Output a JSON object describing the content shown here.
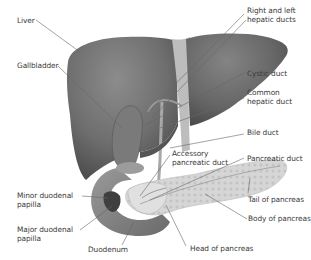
{
  "diagram": {
    "colors": {
      "liver": "#6f6f6f",
      "liver_shadow": "#4a4a4a",
      "ligament": "#b9b9b9",
      "duodenum": "#8a8a8a",
      "pancreas": "#d4d4d4",
      "leader_line": "#555555",
      "label_text": "#3a3a3a"
    },
    "labels": {
      "liver": "Liver",
      "gallbladder": "Gallbladder",
      "right_left_hepatic_1": "Right and left",
      "right_left_hepatic_2": "hepatic ducts",
      "cystic_duct": "Cystic duct",
      "common_hepatic_1": "Common",
      "common_hepatic_2": "hepatic duct",
      "bile_duct": "Bile duct",
      "accessory_1": "Accessory",
      "accessory_2": "pancreatic duct",
      "pancreatic_duct": "Pancreatic duct",
      "minor_papilla_1": "Minor duodenal",
      "minor_papilla_2": "papilla",
      "major_papilla_1": "Major duodenal",
      "major_papilla_2": "papilla",
      "tail_pancreas": "Tail of pancreas",
      "body_pancreas": "Body of pancreas",
      "duodenum": "Duodenum",
      "head_pancreas": "Head of pancreas"
    }
  }
}
